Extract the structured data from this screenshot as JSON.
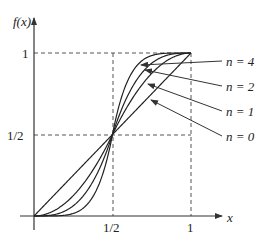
{
  "chart_data": {
    "type": "line",
    "title": "",
    "xlabel": "x",
    "ylabel": "f(x)",
    "xlim": [
      0,
      1
    ],
    "ylim": [
      0,
      1
    ],
    "x_ticks": [
      {
        "value": 0.5,
        "label": "1/2"
      },
      {
        "value": 1,
        "label": "1"
      }
    ],
    "y_ticks": [
      {
        "value": 0.5,
        "label": "1/2"
      },
      {
        "value": 1,
        "label": "1"
      }
    ],
    "grid": false,
    "guides": "dashed lines at x=1/2, x=1, y=1/2, y=1",
    "legend_position": "right, with pointer arrows",
    "series": [
      {
        "name": "n = 0",
        "n": 0,
        "x": [
          0,
          0.25,
          0.5,
          0.75,
          1
        ],
        "values": [
          0,
          0.25,
          0.5,
          0.75,
          1
        ]
      },
      {
        "name": "n = 1",
        "n": 1,
        "x": [
          0,
          0.25,
          0.5,
          0.75,
          1
        ],
        "values": [
          0,
          0.125,
          0.5,
          0.875,
          1
        ]
      },
      {
        "name": "n = 2",
        "n": 2,
        "x": [
          0,
          0.25,
          0.5,
          0.75,
          1
        ],
        "values": [
          0,
          0.0625,
          0.5,
          0.9375,
          1
        ]
      },
      {
        "name": "n = 4",
        "n": 4,
        "x": [
          0,
          0.25,
          0.5,
          0.75,
          1
        ],
        "values": [
          0,
          0.0156,
          0.5,
          0.9844,
          1
        ]
      }
    ]
  },
  "labels": {
    "ylabel": "f(x)",
    "xlabel": "x",
    "y_one": "1",
    "y_half": "1/2",
    "x_half": "1/2",
    "x_one": "1",
    "n4": "n = 4",
    "n2": "n = 2",
    "n1": "n = 1",
    "n0": "n = 0"
  }
}
